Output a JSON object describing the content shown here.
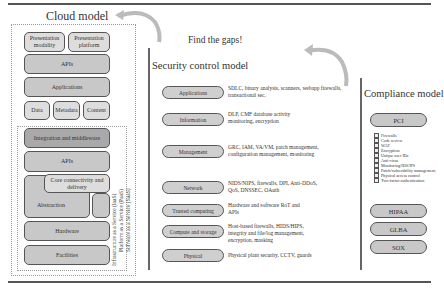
{
  "cloud_model": {
    "title": "Cloud model",
    "boxes": {
      "presentation_modality": "Presentation modality",
      "presentation_platform": "Presentation platform",
      "apis_top": "APIs",
      "applications": "Applications",
      "data": "Data",
      "metadata": "Metadata",
      "content": "Content",
      "integration": "Integration and middleware",
      "apis_mid": "APIs",
      "core_connectivity": "Core connectivity and delivery",
      "abstraction": "Abstraction",
      "hardware": "Hardware",
      "facilities": "Facilities"
    },
    "service_labels": {
      "iaas": "Infrastructure as a Service (IaaS)",
      "paas": "Platform as a Service (PaaS)",
      "saas": "Software as a Service (SaaS)"
    }
  },
  "center_caption": "Find the gaps!",
  "security_control_model": {
    "title": "Security control model",
    "rows": [
      {
        "label": "Applications",
        "description": "SDLC, binary analysis, scanners, webapp firewalls, transactional sec."
      },
      {
        "label": "Information",
        "description": "DLP, CMF database activity monitoring, encryption"
      },
      {
        "label": "Management",
        "description": "GRC, IAM, VA/VM, patch management, configuration management, monitoring"
      },
      {
        "label": "Network",
        "description": "NIDS/NIPS, firewalls, DPI, Anti-DDoS, QoS, DNSSEC, OAuth"
      },
      {
        "label": "Trusted computing",
        "description": "Hardware and software RoT and APIs"
      },
      {
        "label": "Compute and storage",
        "description": "Host-based firewalls, HIDS/HIPS, integrity and file/log management, encryption, masking"
      },
      {
        "label": "Physical",
        "description": "Physical plant security, CCTV, guards"
      }
    ]
  },
  "compliance_model": {
    "title": "Compliance model",
    "standards": [
      "PCI",
      "HIPAA",
      "GLBA",
      "SOX"
    ],
    "pci_checklist": [
      "Firewalls",
      "Code review",
      "WAF",
      "Encryption",
      "Unique user IDs",
      "Anti-virus",
      "Monitoring/IDS/IPS",
      "Patch/vulnerability management",
      "Physical access control",
      "Two-factor authentication"
    ]
  }
}
